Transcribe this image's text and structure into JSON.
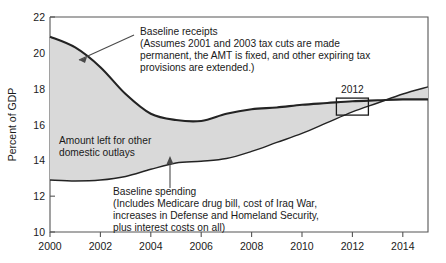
{
  "chart_data": {
    "type": "area",
    "title": "",
    "xlabel": "",
    "ylabel": "Percent of GDP",
    "xlim": [
      2000,
      2015
    ],
    "ylim": [
      10,
      22
    ],
    "xticks": [
      2000,
      2002,
      2004,
      2006,
      2008,
      2010,
      2012,
      2014
    ],
    "yticks": [
      10,
      12,
      14,
      16,
      18,
      20,
      22
    ],
    "grid": false,
    "legend_position": "none",
    "fill_color": "#d9d9d9",
    "line_color": "#232323",
    "x": [
      2000,
      2001,
      2002,
      2003,
      2004,
      2005,
      2006,
      2007,
      2008,
      2009,
      2010,
      2011,
      2012,
      2013,
      2014,
      2015
    ],
    "series": [
      {
        "name": "Baseline receipts",
        "values": [
          20.9,
          20.3,
          19.2,
          17.7,
          16.6,
          16.25,
          16.2,
          16.6,
          16.85,
          16.95,
          17.1,
          17.2,
          17.3,
          17.35,
          17.4,
          17.4
        ]
      },
      {
        "name": "Baseline spending",
        "values": [
          12.9,
          12.85,
          12.9,
          13.1,
          13.5,
          13.85,
          13.95,
          14.1,
          14.5,
          15.0,
          15.5,
          16.1,
          16.7,
          17.2,
          17.7,
          18.1
        ]
      }
    ],
    "annotations": [
      {
        "name": "baseline-receipts",
        "lines": [
          "Baseline receipts",
          "(Assumes 2001 and 2003 tax cuts are made",
          "permanent, the AMT is fixed, and other expiring tax",
          "provisions are extended.)"
        ]
      },
      {
        "name": "amount-left",
        "lines": [
          "Amount left for other",
          "domestic outlays"
        ]
      },
      {
        "name": "baseline-spending",
        "lines": [
          "Baseline spending",
          "(Includes Medicare drug bill, cost of Iraq War,",
          "increases in Defense and Homeland Security,",
          "plus interest costs on all)"
        ]
      }
    ],
    "callout": {
      "name": "crossover-2012",
      "label": "2012",
      "x": 2012,
      "y": 17.0
    }
  }
}
